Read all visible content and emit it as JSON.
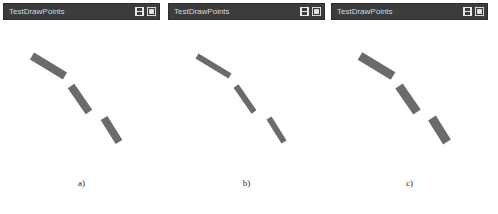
{
  "figure": {
    "background": "#ffffff",
    "line_color": "#6b6b6b",
    "titlebar_color": "#3c3c3c",
    "titlebar_text_color": "#d8d8d8"
  },
  "panels": [
    {
      "title": "TestDrawPoints",
      "caption": "a)",
      "line_width": 8,
      "buttons": [
        {
          "name": "save-icon",
          "label": "Save"
        },
        {
          "name": "maximize-icon",
          "label": "Maximize"
        }
      ],
      "segments": [
        {
          "x1": 29,
          "y1": 36,
          "x2": 62,
          "y2": 56
        },
        {
          "x1": 68,
          "y1": 66,
          "x2": 86,
          "y2": 92
        },
        {
          "x1": 101,
          "y1": 98,
          "x2": 116,
          "y2": 122
        }
      ]
    },
    {
      "title": "TestDrawPoints",
      "caption": "b)",
      "line_width": 6,
      "buttons": [
        {
          "name": "save-icon",
          "label": "Save"
        },
        {
          "name": "maximize-icon",
          "label": "Maximize"
        }
      ],
      "segments": [
        {
          "x1": 29,
          "y1": 36,
          "x2": 62,
          "y2": 56
        },
        {
          "x1": 68,
          "y1": 66,
          "x2": 86,
          "y2": 92
        },
        {
          "x1": 101,
          "y1": 98,
          "x2": 116,
          "y2": 122
        }
      ]
    },
    {
      "title": "TestDrawPoints",
      "caption": "c)",
      "line_width": 9,
      "buttons": [
        {
          "name": "save-icon",
          "label": "Save"
        },
        {
          "name": "maximize-icon",
          "label": "Maximize"
        }
      ],
      "segments": [
        {
          "x1": 29,
          "y1": 36,
          "x2": 62,
          "y2": 56
        },
        {
          "x1": 68,
          "y1": 66,
          "x2": 86,
          "y2": 92
        },
        {
          "x1": 101,
          "y1": 98,
          "x2": 116,
          "y2": 122
        }
      ]
    }
  ]
}
